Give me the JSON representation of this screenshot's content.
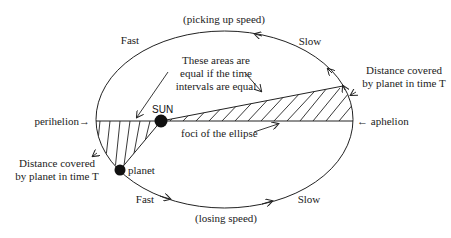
{
  "diagram": {
    "top_label": "(picking up speed)",
    "bottom_label": "(losing speed)",
    "fast_top": "Fast",
    "slow_top": "Slow",
    "fast_bottom": "Fast",
    "slow_bottom": "Slow",
    "areas_note": [
      "These areas are",
      "equal if the time",
      "intervals are equal"
    ],
    "sun_label": "SUN",
    "planet_label": "planet",
    "foci_label": "foci of the ellipse",
    "perihelion_label": "perihelion→",
    "aphelion_label": "← aphelion",
    "distance_right": [
      "Distance covered",
      "by planet in time T"
    ],
    "distance_left": [
      "Distance covered",
      "by planet in time T"
    ],
    "colors": {
      "stroke": "#222222",
      "background": "#ffffff"
    }
  }
}
